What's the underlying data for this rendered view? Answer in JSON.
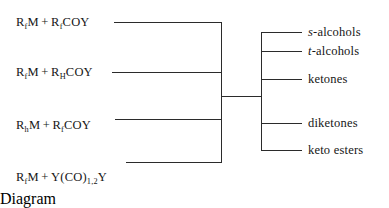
{
  "diagram": {
    "background_color": "#ffffff",
    "line_color": "#2b2b2b",
    "text_color": "#161616",
    "reactants": [
      {
        "id": "reactant-1",
        "text": "RfM + RfCOY",
        "parts": [
          {
            "t": "R"
          },
          {
            "t": "f",
            "sub": true
          },
          {
            "t": "M"
          },
          {
            "t": "+",
            "plus": true
          },
          {
            "t": "R"
          },
          {
            "t": "f",
            "sub": true
          },
          {
            "t": "COY"
          }
        ]
      },
      {
        "id": "reactant-2",
        "text": "RfM + RHCOY",
        "parts": [
          {
            "t": "R"
          },
          {
            "t": "f",
            "sub": true
          },
          {
            "t": "M"
          },
          {
            "t": "+",
            "plus": true
          },
          {
            "t": "R"
          },
          {
            "t": "H",
            "sub": true
          },
          {
            "t": "COY"
          }
        ]
      },
      {
        "id": "reactant-3",
        "text": "RhM + RfCOY",
        "parts": [
          {
            "t": "R"
          },
          {
            "t": "h",
            "sub": true
          },
          {
            "t": "M"
          },
          {
            "t": "+",
            "plus": true
          },
          {
            "t": "R"
          },
          {
            "t": "f",
            "sub": true
          },
          {
            "t": "COY"
          }
        ]
      },
      {
        "id": "reactant-4",
        "text": "RfM + Y(CO)1,2Y",
        "parts": [
          {
            "t": "R"
          },
          {
            "t": "f",
            "sub": true
          },
          {
            "t": "M"
          },
          {
            "t": "+",
            "plus": true
          },
          {
            "t": "Y(CO)"
          },
          {
            "t": "1,2",
            "sub": true
          },
          {
            "t": "Y"
          }
        ]
      }
    ],
    "products": [
      {
        "id": "product-1",
        "prefix": "s",
        "prefix_italic": true,
        "text": "s-alcohols",
        "body": "-alcohols"
      },
      {
        "id": "product-2",
        "prefix": "t",
        "prefix_italic": true,
        "text": "t-alcohols",
        "body": "-alcohols"
      },
      {
        "id": "product-3",
        "prefix": "",
        "prefix_italic": false,
        "text": "ketones",
        "body": "ketones"
      },
      {
        "id": "product-4",
        "prefix": "",
        "prefix_italic": false,
        "text": "diketones",
        "body": "diketones"
      },
      {
        "id": "product-5",
        "prefix": "",
        "prefix_italic": false,
        "text": "keto esters",
        "body": "keto esters"
      }
    ]
  }
}
